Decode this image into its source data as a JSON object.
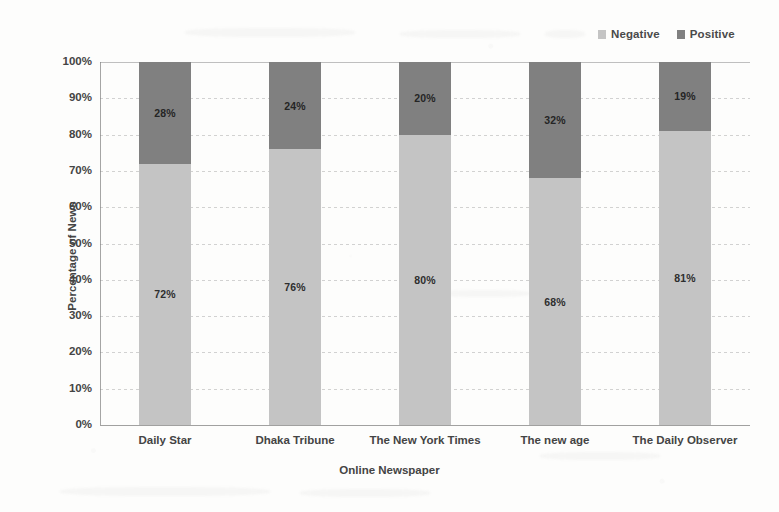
{
  "chart_data": {
    "type": "bar",
    "subtype": "stacked-100-percent",
    "title": "",
    "xlabel": "Online Newspaper",
    "ylabel": "Percentage of News",
    "categories": [
      "Daily Star",
      "Dhaka Tribune",
      "The New York Times",
      "The new age",
      "The Daily Observer"
    ],
    "series": [
      {
        "name": "Negative",
        "color": "#c4c4c4",
        "values": [
          72,
          76,
          80,
          68,
          81
        ],
        "labels": [
          "72%",
          "76%",
          "80%",
          "68%",
          "81%"
        ]
      },
      {
        "name": "Positive",
        "color": "#808080",
        "values": [
          28,
          24,
          20,
          32,
          19
        ],
        "labels": [
          "28%",
          "24%",
          "20%",
          "32%",
          "19%"
        ]
      }
    ],
    "ylim": [
      0,
      100
    ],
    "y_ticks": [
      0,
      10,
      20,
      30,
      40,
      50,
      60,
      70,
      80,
      90,
      100
    ],
    "y_tick_labels": [
      "0%",
      "10%",
      "20%",
      "30%",
      "40%",
      "50%",
      "60%",
      "70%",
      "80%",
      "90%",
      "100%"
    ],
    "grid": true,
    "legend_position": "top-right",
    "stack_order_bottom_to_top": [
      "Negative",
      "Positive"
    ]
  },
  "legend": {
    "items": [
      {
        "label": "Negative",
        "color": "#c4c4c4"
      },
      {
        "label": "Positive",
        "color": "#808080"
      }
    ]
  },
  "axes": {
    "y_title": "Percentage of News",
    "x_title": "Online Newspaper"
  }
}
